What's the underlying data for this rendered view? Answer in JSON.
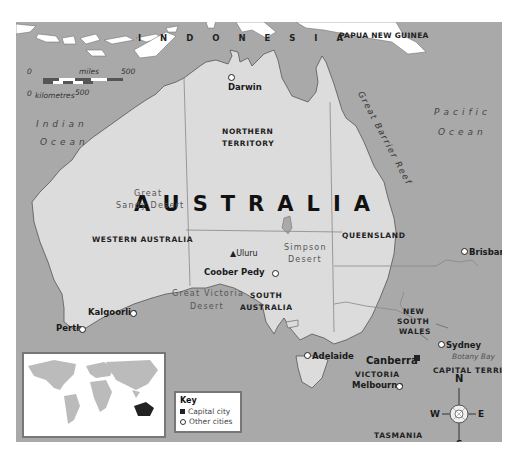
{
  "map": {
    "title": "AUSTRALIA",
    "colors": {
      "sea": "#a9a9a9",
      "land": "#dcdcdc",
      "background": "#ffffff",
      "border": "#777777"
    },
    "countries": [
      {
        "name": "INDONESIA",
        "text": "I N D O N E S I A"
      },
      {
        "name": "PAPUA NEW GUINEA",
        "text": "PAPUA NEW GUINEA"
      }
    ],
    "oceans": [
      {
        "line1": "Indian",
        "line2": "Ocean"
      },
      {
        "line1": "Pacific",
        "line2": "Ocean"
      }
    ],
    "states": {
      "nt_line1": "NORTHERN",
      "nt_line2": "TERRITORY",
      "wa": "WESTERN AUSTRALIA",
      "qld": "QUEENSLAND",
      "sa_line1": "SOUTH",
      "sa_line2": "AUSTRALIA",
      "nsw_line1": "NEW",
      "nsw_line2": "SOUTH",
      "nsw_line3": "WALES",
      "vic": "VICTORIA",
      "tas": "TASMANIA",
      "act": "CAPITAL TERRITORY"
    },
    "deserts": {
      "great_sandy_1": "Great",
      "great_sandy_2": "Sandy Desert",
      "simpson_1": "Simpson",
      "simpson_2": "Desert",
      "victoria_1": "Great Victoria",
      "victoria_2": "Desert"
    },
    "features": {
      "reef": "Great Barrier Reef",
      "uluru": "Uluru",
      "botany_bay": "Botany Bay"
    },
    "cities": {
      "darwin": "Darwin",
      "brisbane": "Brisbane",
      "coober_pedy": "Coober Pedy",
      "kalgoorlie": "Kalgoorlie",
      "perth": "Perth",
      "adelaide": "Adelaide",
      "melbourne": "Melbourne",
      "sydney": "Sydney",
      "canberra": "Canberra",
      "hobart": "Hobart"
    },
    "scale": {
      "miles_label": "miles",
      "km_label": "kilometres",
      "miles_zero": "0",
      "miles_max": "500",
      "km_zero": "0",
      "km_max": "500"
    },
    "compass": {
      "n": "N",
      "s": "S",
      "e": "E",
      "w": "W"
    },
    "key": {
      "title": "Key",
      "capital": "Capital city",
      "other": "Other cities"
    }
  }
}
